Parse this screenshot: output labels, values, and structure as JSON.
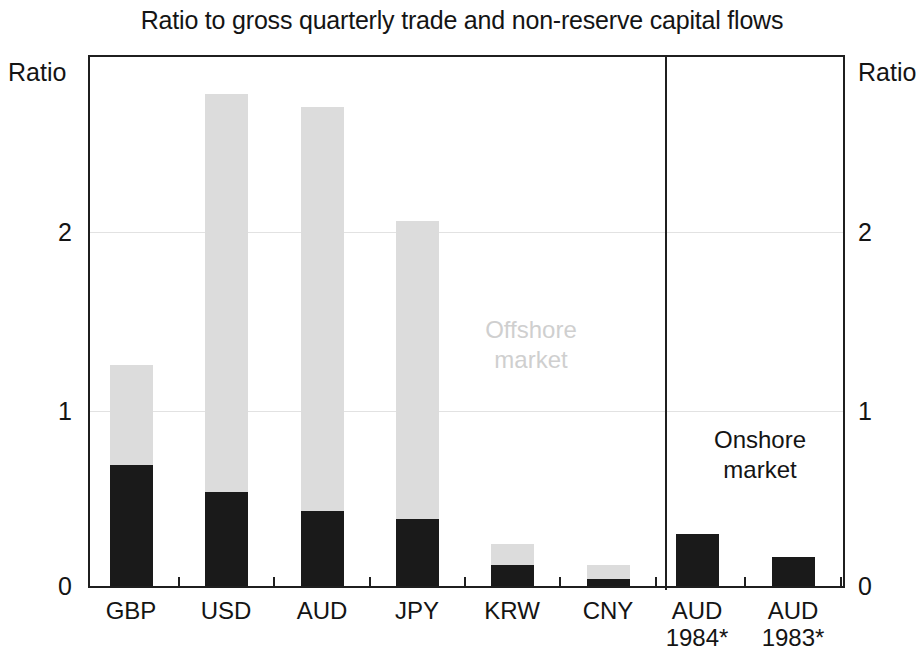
{
  "chart_data": {
    "type": "bar",
    "title": "Ratio to gross quarterly trade and non-reserve capital flows",
    "xlabel": "",
    "ylabel": "Ratio",
    "ylim": [
      0,
      2.75
    ],
    "yticks": [
      0,
      1,
      2
    ],
    "ytick_labels": [
      "0",
      "1",
      "2"
    ],
    "grid": true,
    "stacked": true,
    "legend_position": "in-plot annotations",
    "axis_unit_left": "Ratio",
    "axis_unit_right": "Ratio",
    "panels": [
      {
        "id": "left",
        "header": "Q2 2013"
      },
      {
        "id": "right",
        "header": "1983/4"
      }
    ],
    "series": [
      {
        "name": "Onshore market",
        "color": "#1a1a1a",
        "values": [
          0.63,
          0.49,
          0.39,
          0.35,
          0.11,
          0.035,
          0.27,
          0.15
        ]
      },
      {
        "name": "Offshore market",
        "color": "#dcdcdc",
        "values": [
          0.52,
          2.07,
          2.1,
          1.55,
          0.11,
          0.075,
          0.0,
          0.0
        ]
      }
    ],
    "totals": [
      1.15,
      2.56,
      2.49,
      1.9,
      0.22,
      0.11,
      0.27,
      0.15
    ],
    "categories": [
      "GBP",
      "USD",
      "AUD",
      "JPY",
      "KRW",
      "CNY",
      "AUD 1984*",
      "AUD 1983*"
    ],
    "category_labels": [
      {
        "line1": "GBP",
        "line2": ""
      },
      {
        "line1": "USD",
        "line2": ""
      },
      {
        "line1": "AUD",
        "line2": ""
      },
      {
        "line1": "JPY",
        "line2": ""
      },
      {
        "line1": "KRW",
        "line2": ""
      },
      {
        "line1": "CNY",
        "line2": ""
      },
      {
        "line1": "AUD",
        "line2": "1984*"
      },
      {
        "line1": "AUD",
        "line2": "1983*"
      }
    ],
    "annotations": [
      {
        "id": "offshore",
        "line1": "Offshore",
        "line2": "market",
        "color": "#cfcfcf"
      },
      {
        "id": "onshore",
        "line1": "Onshore",
        "line2": "market",
        "color": "#141414"
      }
    ]
  }
}
